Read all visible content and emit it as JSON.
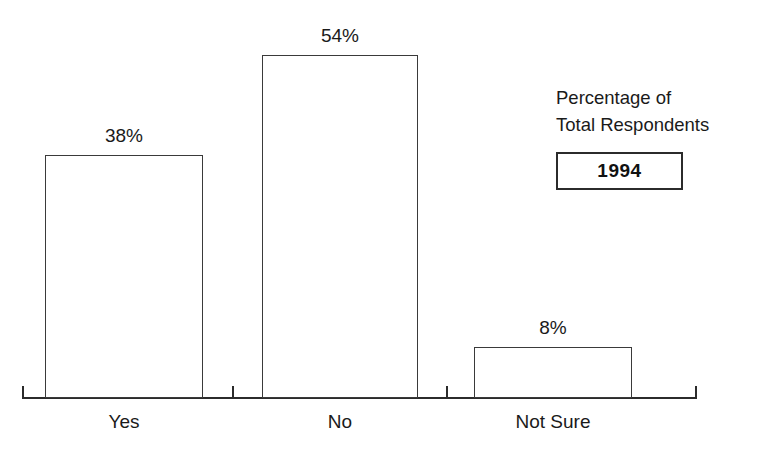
{
  "chart_data": {
    "type": "bar",
    "title": "",
    "subtitle": "",
    "xlabel": "",
    "ylabel": "",
    "categories": [
      "Yes",
      "No",
      "Not Sure"
    ],
    "values": [
      38,
      54,
      8
    ],
    "value_labels": [
      "38%",
      "54%",
      "8%"
    ],
    "ylim": [
      0,
      62
    ],
    "grid": false,
    "legend_position": "right",
    "legend": {
      "title_line1": "Percentage of",
      "title_line2": "Total Respondents",
      "boxed_label": "1994"
    },
    "style": {
      "bar_fill": "#ffffff",
      "bar_stroke": "#3a3a3a",
      "axis_color": "#2b2b2b",
      "text_color": "#1a1a1a",
      "background": "#ffffff"
    }
  },
  "bars": [
    {
      "category": "Yes",
      "value": 38,
      "label": "38%",
      "left": 45,
      "width": 158,
      "top": 155,
      "height": 243,
      "label_left": 45,
      "label_top": 126,
      "cat_left": 45,
      "cat_top": 412
    },
    {
      "category": "No",
      "value": 54,
      "label": "54%",
      "left": 262,
      "width": 156,
      "top": 55,
      "height": 343,
      "label_left": 262,
      "label_top": 26,
      "cat_left": 262,
      "cat_top": 412
    },
    {
      "category": "Not Sure",
      "value": 8,
      "label": "8%",
      "left": 474,
      "width": 158,
      "top": 347,
      "height": 51,
      "label_left": 474,
      "label_top": 318,
      "cat_left": 474,
      "cat_top": 412
    }
  ],
  "axis": {
    "baseline_left": 22,
    "baseline_top": 397,
    "baseline_width": 675,
    "baseline_thickness": 2,
    "end_ticks": [
      {
        "left": 22,
        "top": 386,
        "height": 12
      },
      {
        "left": 695,
        "top": 386,
        "height": 12
      }
    ],
    "minor_ticks": [
      {
        "left": 232,
        "top": 386,
        "height": 12
      },
      {
        "left": 446,
        "top": 386,
        "height": 12
      }
    ]
  }
}
